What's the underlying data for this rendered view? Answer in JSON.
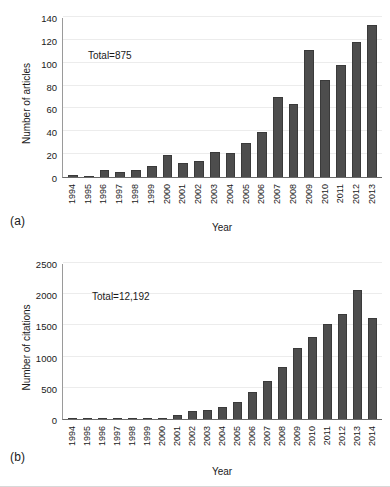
{
  "figure": {
    "panel_a_label": "(a)",
    "panel_b_label": "(b)"
  },
  "chart_data": [
    {
      "type": "bar",
      "id": "articles-per-year",
      "title": "",
      "annotation": "Total=875",
      "xlabel": "Year",
      "ylabel": "Number of articles",
      "ylim": [
        0,
        140
      ],
      "ytick_step": 20,
      "yticks": [
        0,
        20,
        40,
        60,
        80,
        100,
        120,
        140
      ],
      "ytick_labels": [
        "0",
        "20",
        "40",
        "60",
        "80",
        "100",
        "120",
        "140"
      ],
      "grid": true,
      "legend": "none",
      "bar_color": "#4d4d4d",
      "bar_edge_color": "#3a3a3a",
      "categories": [
        "1994",
        "1995",
        "1996",
        "1997",
        "1998",
        "1999",
        "2000",
        "2001",
        "2002",
        "2003",
        "2004",
        "2005",
        "2006",
        "2007",
        "2008",
        "2009",
        "2010",
        "2011",
        "2012",
        "2013"
      ],
      "values": [
        2,
        1,
        6,
        4,
        6,
        10,
        19,
        12,
        14,
        22,
        21,
        30,
        39,
        70,
        64,
        111,
        85,
        98,
        118,
        133
      ]
    },
    {
      "type": "bar",
      "id": "citations-per-year",
      "title": "",
      "annotation": "Total=12,192",
      "xlabel": "Year",
      "ylabel": "Number of citations",
      "ylim": [
        0,
        2500
      ],
      "ytick_step": 500,
      "yticks": [
        0,
        500,
        1000,
        1500,
        2000,
        2500
      ],
      "ytick_labels": [
        "0",
        "500",
        "1000",
        "1500",
        "2000",
        "2500"
      ],
      "grid": true,
      "legend": "none",
      "bar_color": "#4d4d4d",
      "bar_edge_color": "#3a3a3a",
      "categories": [
        "1994",
        "1995",
        "1996",
        "1997",
        "1998",
        "1999",
        "2000",
        "2001",
        "2002",
        "2003",
        "2004",
        "2005",
        "2006",
        "2007",
        "2008",
        "2009",
        "2010",
        "2011",
        "2012",
        "2013",
        "2014"
      ],
      "values": [
        2,
        2,
        8,
        5,
        6,
        18,
        20,
        62,
        128,
        150,
        190,
        270,
        430,
        610,
        830,
        1140,
        1320,
        1515,
        1685,
        2060,
        1620
      ]
    }
  ]
}
